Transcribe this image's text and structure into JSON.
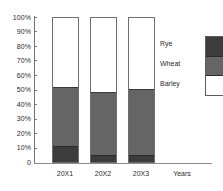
{
  "chart_data": {
    "type": "bar",
    "stacked": true,
    "normalized_percent": true,
    "title": "",
    "subtitle": "",
    "xlabel": "Years",
    "ylabel": "",
    "categories": [
      "20X1",
      "20X2",
      "20X3"
    ],
    "ylim": [
      0,
      100
    ],
    "ytick_labels": [
      "100%",
      "90%",
      "80%",
      "70%",
      "60%",
      "50%",
      "40%",
      "30%",
      "20%",
      "10%",
      "0"
    ],
    "ytick_values": [
      100,
      90,
      80,
      70,
      60,
      50,
      40,
      30,
      20,
      10,
      0
    ],
    "grid": false,
    "legend_position": "right",
    "series": [
      {
        "name": "Rye",
        "color": "#3c3c3c",
        "values": [
          11,
          5,
          5
        ]
      },
      {
        "name": "Wheat",
        "color": "#656565",
        "values": [
          41,
          43.5,
          45.5
        ]
      },
      {
        "name": "Barley",
        "color": "#ffffff",
        "values": [
          48,
          51.5,
          49.5
        ]
      }
    ],
    "stack_order_top_to_bottom": [
      "Barley",
      "Wheat",
      "Rye"
    ]
  },
  "axes": {
    "x_axis_caption": "Years",
    "y_ticks": [
      {
        "label": "100%",
        "value": 100
      },
      {
        "label": "90%",
        "value": 90
      },
      {
        "label": "80%",
        "value": 80
      },
      {
        "label": "70%",
        "value": 70
      },
      {
        "label": "60%",
        "value": 60
      },
      {
        "label": "50%",
        "value": 50
      },
      {
        "label": "40%",
        "value": 40
      },
      {
        "label": "30%",
        "value": 30
      },
      {
        "label": "20%",
        "value": 20
      },
      {
        "label": "10%",
        "value": 10
      },
      {
        "label": "0",
        "value": 0
      }
    ],
    "x_ticks": [
      {
        "label": "20X1"
      },
      {
        "label": "20X2"
      },
      {
        "label": "20X3"
      }
    ]
  },
  "legend": {
    "entries": [
      {
        "label": "Rye",
        "color": "#3c3c3c"
      },
      {
        "label": "Wheat",
        "color": "#656565"
      },
      {
        "label": "Barley",
        "color": "#ffffff"
      }
    ]
  },
  "colors": {
    "rye": "#3c3c3c",
    "wheat": "#656565",
    "barley": "#ffffff",
    "axis": "#777777",
    "text": "#2b2b2b",
    "background": "#ffffff"
  }
}
